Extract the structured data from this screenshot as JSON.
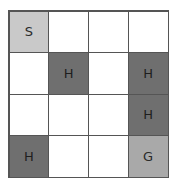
{
  "game": {
    "name": "grid-world",
    "rows": 4,
    "cols": 4,
    "legend": {
      "S": "start",
      "H": "hole",
      "G": "goal",
      "": "frozen"
    },
    "colors": {
      "start": "#c9c9c9",
      "hole": "#6f6f6f",
      "goal": "#a9a9a9",
      "frozen": "#ffffff",
      "border": "#555555"
    },
    "cells": [
      [
        "S",
        "",
        "",
        ""
      ],
      [
        "",
        "H",
        "",
        "H"
      ],
      [
        "",
        "",
        "",
        "H"
      ],
      [
        "H",
        "",
        "",
        "G"
      ]
    ]
  }
}
